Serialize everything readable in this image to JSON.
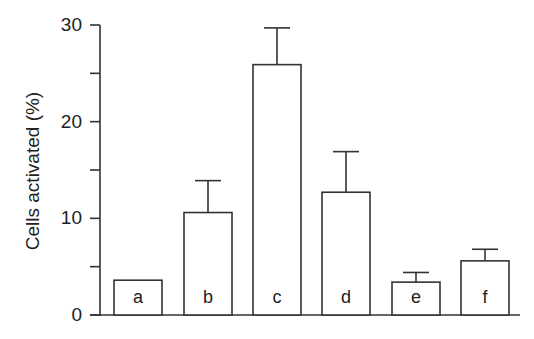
{
  "chart_data": {
    "type": "bar",
    "title": "",
    "xlabel": "",
    "ylabel": "Cells activated (%)",
    "categories": [
      "a",
      "b",
      "c",
      "d",
      "e",
      "f"
    ],
    "values": [
      3.6,
      10.6,
      25.9,
      12.7,
      3.4,
      5.6
    ],
    "error_upper": [
      0,
      3.3,
      3.8,
      4.2,
      1.0,
      1.2
    ],
    "ylim": [
      0,
      30
    ],
    "yticks": [
      0,
      10,
      20,
      30
    ],
    "yticks_minor": [
      5,
      15,
      25
    ],
    "ytick_labels": [
      "0",
      "10",
      "20",
      "30"
    ],
    "bar_labels_inside": true,
    "grid": false,
    "legend": null,
    "colors": {
      "bar_fill": "#ffffff",
      "bar_edge": "#333333",
      "axis": "#333333"
    }
  }
}
